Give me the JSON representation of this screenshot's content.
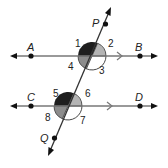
{
  "diagram": {
    "type": "parallel-lines-cut-by-transversal",
    "colors": {
      "line": "#777777",
      "ink": "#111111",
      "dark_angle": "#1e1e1e",
      "medium_angle": "#8c8c8c",
      "light_angle": "#b4b4b4",
      "outline_angle": "#ffffff"
    },
    "lines": {
      "ab": {
        "label": "line AB",
        "parallel_mark": ">"
      },
      "cd": {
        "label": "line CD",
        "parallel_mark": ">"
      },
      "transversal": {
        "label": "line PQ"
      }
    },
    "points": {
      "A": "A",
      "B": "B",
      "C": "C",
      "D": "D",
      "P": "P",
      "Q": "Q"
    },
    "angles": {
      "a1": {
        "label": "1",
        "shade": "dark"
      },
      "a2": {
        "label": "2",
        "shade": "light"
      },
      "a3": {
        "label": "3",
        "shade": "none"
      },
      "a4": {
        "label": "4",
        "shade": "medium"
      },
      "a5": {
        "label": "5",
        "shade": "dark"
      },
      "a6": {
        "label": "6",
        "shade": "light"
      },
      "a7": {
        "label": "7",
        "shade": "none"
      },
      "a8": {
        "label": "8",
        "shade": "medium"
      }
    }
  }
}
